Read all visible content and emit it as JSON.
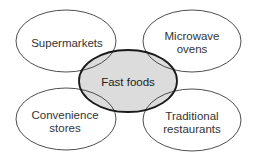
{
  "diagram": {
    "type": "overlapping-ellipses",
    "center": {
      "label": "Fast foods",
      "fill": "#dcdcdc",
      "stroke": "#1a1a1a"
    },
    "satellites": [
      {
        "id": "top-left",
        "line1": "Supermarkets",
        "line2": ""
      },
      {
        "id": "top-right",
        "line1": "Microwave",
        "line2": "ovens"
      },
      {
        "id": "bottom-left",
        "line1": "Convenience",
        "line2": "stores"
      },
      {
        "id": "bottom-right",
        "line1": "Traditional",
        "line2": "restaurants"
      }
    ],
    "colors": {
      "outline": "#3a3a3a",
      "background": "#ffffff",
      "text": "#333333"
    }
  }
}
